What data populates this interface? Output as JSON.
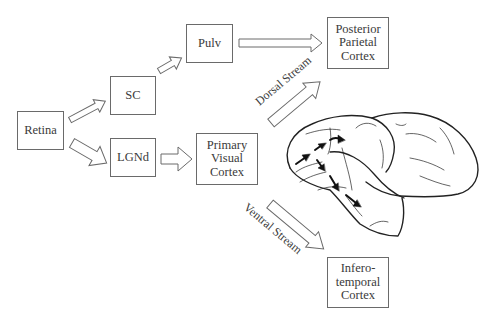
{
  "diagram": {
    "type": "visual-pathway-flow",
    "nodes": [
      {
        "id": "retina",
        "lines": [
          "Retina"
        ]
      },
      {
        "id": "sc",
        "lines": [
          "SC"
        ]
      },
      {
        "id": "lgnd",
        "lines": [
          "LGNd"
        ]
      },
      {
        "id": "pulv",
        "lines": [
          "Pulv"
        ]
      },
      {
        "id": "primary_visual_cortex",
        "lines": [
          "Primary",
          "Visual",
          "Cortex"
        ]
      },
      {
        "id": "posterior_parietal_cortex",
        "lines": [
          "Posterior",
          "Parietal",
          "Cortex"
        ]
      },
      {
        "id": "inferotemporal_cortex",
        "lines": [
          "Infero-",
          "temporal",
          "Cortex"
        ]
      }
    ],
    "edges": [
      {
        "from": "retina",
        "to": "sc"
      },
      {
        "from": "retina",
        "to": "lgnd"
      },
      {
        "from": "sc",
        "to": "pulv"
      },
      {
        "from": "pulv",
        "to": "posterior_parietal_cortex"
      },
      {
        "from": "lgnd",
        "to": "primary_visual_cortex"
      },
      {
        "from": "primary_visual_cortex",
        "to": "posterior_parietal_cortex",
        "label": "Dorsal Stream"
      },
      {
        "from": "primary_visual_cortex",
        "to": "inferotemporal_cortex",
        "label": "Ventral Stream"
      }
    ],
    "streams": {
      "dorsal": "Dorsal Stream",
      "ventral": "Ventral Stream"
    },
    "illustration": "brain-lateral-view",
    "colors": {
      "box_border": "#6a6a6a",
      "text": "#3a3a3a",
      "arrow_outline": "#6a6a6a",
      "brain_outline": "#222222",
      "brain_arrows": "#111111"
    }
  }
}
